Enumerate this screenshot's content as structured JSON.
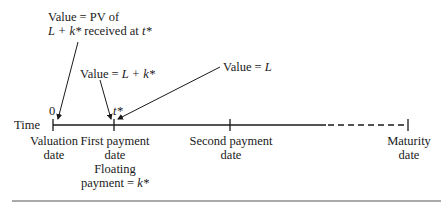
{
  "diagram": {
    "axis_label": "Time",
    "origin_label": "0",
    "tstar_label": "t*",
    "annotations": {
      "pv_line1": "Value = PV of",
      "pv_line2_prefix": "L + k*",
      "pv_line2_suffix": " received at ",
      "pv_line2_var": "t*",
      "lk_prefix": "Value = ",
      "lk_var": "L + k*",
      "l_prefix": "Value = ",
      "l_var": "L"
    },
    "ticks": [
      {
        "line1": "Valuation",
        "line2": "date"
      },
      {
        "line1": "First payment",
        "line2": "date",
        "line3": "Floating",
        "line4_prefix": "payment = ",
        "line4_var": "k*"
      },
      {
        "line1": "Second payment",
        "line2": "date"
      },
      {
        "line1": "Maturity",
        "line2": "date"
      }
    ],
    "colors": {
      "ink": "#1a1a1a",
      "rule": "#555555"
    }
  }
}
